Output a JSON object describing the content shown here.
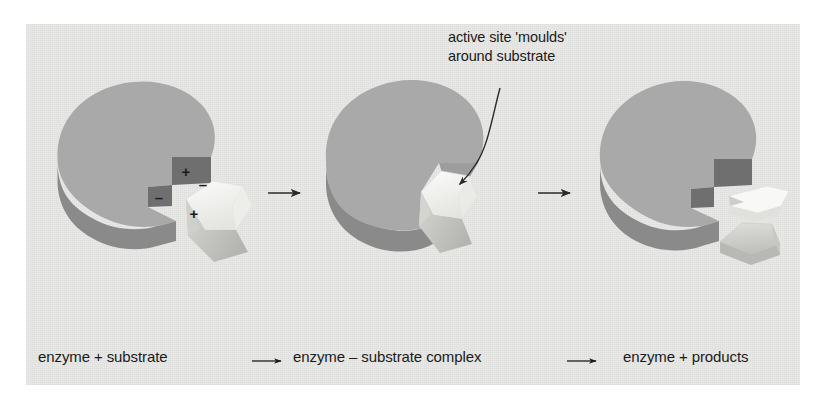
{
  "figure": {
    "background_color": "#e9e9e7",
    "page_color": "#ffffff",
    "ink_color": "#1b1b1b"
  },
  "annotation": {
    "line1": "active site 'moulds'",
    "line2": "around substrate",
    "pointer": "curved-arrow"
  },
  "caption": {
    "stage1": "enzyme + substrate",
    "arrow1": "→",
    "stage2": "enzyme – substrate complex",
    "arrow2": "→",
    "stage3": "enzyme + products"
  },
  "panels": [
    {
      "id": "panel-1",
      "name": "enzyme-plus-substrate",
      "caption": "enzyme + substrate",
      "enzyme": {
        "top_color": "#a9a9a9",
        "side_color": "#8a8a8a",
        "active_site": "stepped-notch",
        "notch_face_color": "#6f6f6f"
      },
      "substrate": {
        "color": "#f4f4f2",
        "shadow_color": "#b9b9b6",
        "shape": "wedge"
      },
      "charges": [
        {
          "symbol": "+",
          "on": "enzyme-upper-notch-face"
        },
        {
          "symbol": "–",
          "on": "enzyme-lower-notch-face"
        },
        {
          "symbol": "–",
          "on": "substrate-upper"
        },
        {
          "symbol": "+",
          "on": "substrate-lower"
        }
      ]
    },
    {
      "id": "panel-2",
      "name": "enzyme-substrate-complex",
      "caption": "enzyme – substrate complex",
      "enzyme": {
        "top_color": "#a9a9a9",
        "side_color": "#8a8a8a",
        "active_site": "moulded-wedge-notch",
        "notch_face_color": "#9a9a9a"
      },
      "substrate": {
        "color": "#f4f4f2",
        "shadow_color": "#c4c4c0",
        "shape": "wedge-bound"
      },
      "charges": []
    },
    {
      "id": "panel-3",
      "name": "enzyme-plus-products",
      "caption": "enzyme + products",
      "enzyme": {
        "top_color": "#a9a9a9",
        "side_color": "#8a8a8a",
        "active_site": "stepped-notch",
        "notch_face_color": "#6f6f6f"
      },
      "products": [
        {
          "id": "product-upper",
          "color": "#f6f6f4",
          "shadow_color": "#cfcfcb"
        },
        {
          "id": "product-lower",
          "color": "#d2d2ce",
          "shadow_color": "#bdbdb9"
        }
      ],
      "charges": []
    }
  ],
  "arrows": {
    "reaction_arrow_1": "→",
    "reaction_arrow_2": "→"
  }
}
